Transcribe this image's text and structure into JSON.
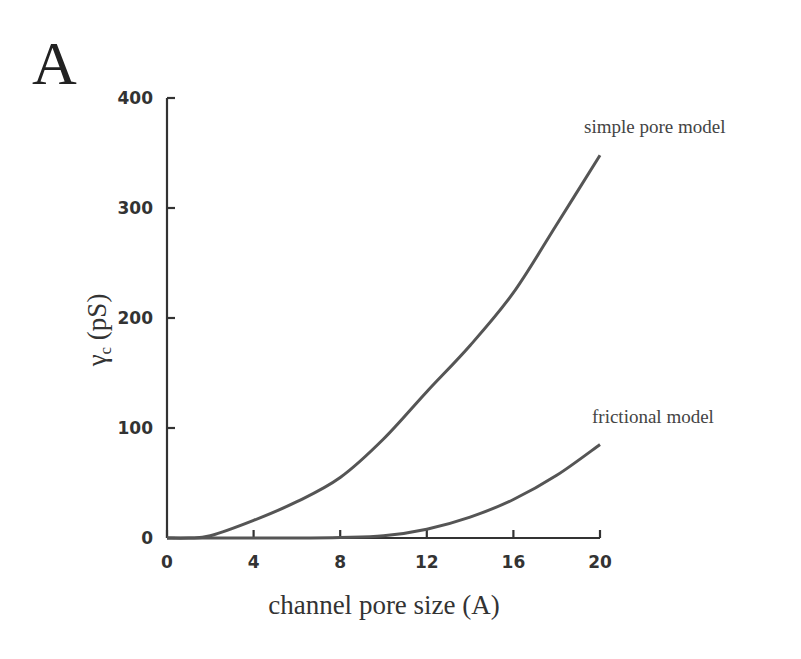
{
  "panel_label": "A",
  "chart_data": {
    "type": "line",
    "title": "",
    "xlabel": "channel pore size (A)",
    "ylabel": "γc (pS)",
    "ylabel_main": "γ",
    "ylabel_sub": "c",
    "ylabel_unit": "(pS)",
    "xlim": [
      0,
      20
    ],
    "ylim": [
      0,
      400
    ],
    "xticks": [
      0,
      4,
      8,
      12,
      16,
      20
    ],
    "yticks": [
      0,
      100,
      200,
      300,
      400
    ],
    "xtick_labels": [
      "0",
      "4",
      "8",
      "12",
      "16",
      "20"
    ],
    "ytick_labels": [
      "0",
      "100",
      "200",
      "300",
      "400"
    ],
    "grid": false,
    "legend": "none (inline curve annotations)",
    "x": [
      0,
      1,
      2,
      4,
      6,
      8,
      10,
      12,
      14,
      16,
      18,
      20
    ],
    "series": [
      {
        "name": "simple pore model",
        "values": [
          0,
          0,
          2,
          16,
          33,
          55,
          90,
          133,
          175,
          223,
          285,
          348
        ]
      },
      {
        "name": "frictional model",
        "values": [
          0,
          0,
          0,
          0,
          0,
          0.5,
          2,
          8,
          19,
          35,
          57,
          85
        ]
      }
    ],
    "annotations": [
      {
        "text": "simple pore model",
        "series": "simple pore model"
      },
      {
        "text": "frictional model",
        "series": "frictional model"
      }
    ]
  }
}
